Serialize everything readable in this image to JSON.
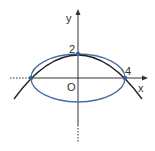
{
  "diagram": {
    "type": "coordinate-plane",
    "axes": {
      "x_label": "x",
      "y_label": "y",
      "origin_label": "O"
    },
    "tick_labels": {
      "y_intercept": "2",
      "x_intercept": "4"
    },
    "curves": [
      {
        "name": "ellipse",
        "description": "x^2/16 + y^2/4 = 1",
        "color": "#4a6fa5"
      },
      {
        "name": "parabola",
        "description": "opening downward through (-4,0), (0,2), (4,0)",
        "color": "#222222"
      }
    ],
    "points": [
      {
        "label": "(-4, 0)"
      },
      {
        "label": "(0, 2)"
      },
      {
        "label": "(4, 0)"
      }
    ],
    "colors": {
      "ellipse": "#4a6fa5",
      "parabola": "#222222",
      "axis": "#333333",
      "point": "#3a5f9a"
    }
  }
}
